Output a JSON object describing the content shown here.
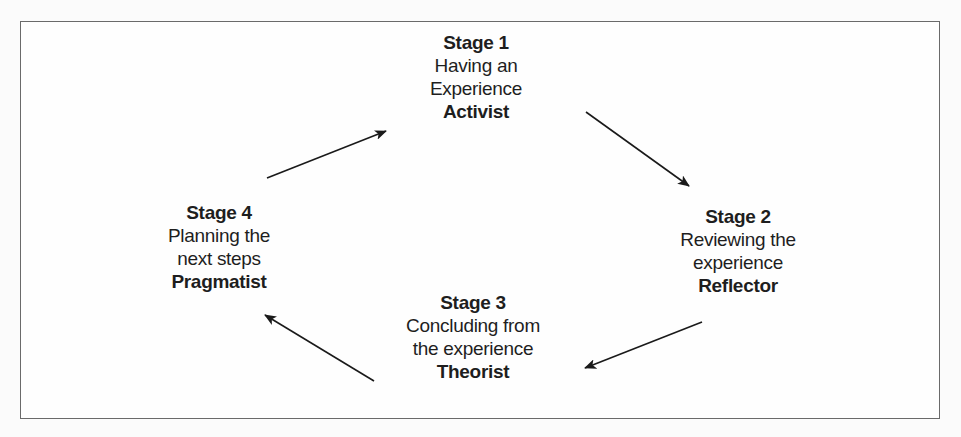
{
  "diagram": {
    "type": "learning-cycle",
    "stages": [
      {
        "title": "Stage 1",
        "desc_lines": [
          "Having an",
          "Experience"
        ],
        "role": "Activist"
      },
      {
        "title": "Stage 2",
        "desc_lines": [
          "Reviewing the",
          "experience"
        ],
        "role": "Reflector"
      },
      {
        "title": "Stage 3",
        "desc_lines": [
          "Concluding from",
          "the experience"
        ],
        "role": "Theorist"
      },
      {
        "title": "Stage 4",
        "desc_lines": [
          "Planning the",
          "next steps"
        ],
        "role": "Pragmatist"
      }
    ],
    "arrows": [
      {
        "from": "Stage 4",
        "to": "Stage 1"
      },
      {
        "from": "Stage 1",
        "to": "Stage 2"
      },
      {
        "from": "Stage 2",
        "to": "Stage 3"
      },
      {
        "from": "Stage 3",
        "to": "Stage 4"
      }
    ],
    "colors": {
      "text": "#1e1e1e",
      "border": "#6a6a6a",
      "arrow": "#1a1a1a"
    }
  }
}
